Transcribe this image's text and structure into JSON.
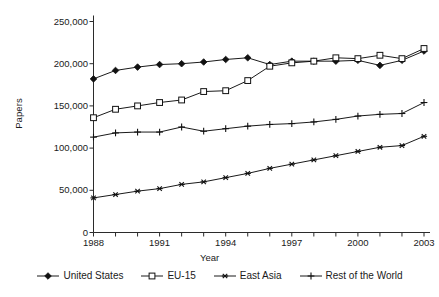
{
  "chart_data": {
    "type": "line",
    "title": "",
    "xlabel": "Year",
    "ylabel": "Papers",
    "xlim": [
      1988,
      2003
    ],
    "ylim": [
      0,
      250000
    ],
    "ytick_values": [
      0,
      50000,
      100000,
      150000,
      200000,
      250000
    ],
    "ytick_labels": [
      "0",
      "50,000",
      "100,000",
      "150,000",
      "200,000",
      "250,000"
    ],
    "xtick_values": [
      1988,
      1991,
      1994,
      1997,
      2000,
      2003
    ],
    "xtick_labels": [
      "1988",
      "1991",
      "1994",
      "1997",
      "2000",
      "2003"
    ],
    "x_minor_ticks": [
      1988,
      1989,
      1990,
      1991,
      1992,
      1993,
      1994,
      1995,
      1996,
      1997,
      1998,
      1999,
      2000,
      2001,
      2002,
      2003
    ],
    "grid": false,
    "legend_position": "bottom",
    "x": [
      1988,
      1989,
      1990,
      1991,
      1992,
      1993,
      1994,
      1995,
      1996,
      1997,
      1998,
      1999,
      2000,
      2001,
      2002,
      2003
    ],
    "series": [
      {
        "name": "United States",
        "marker": "filled-diamond",
        "color": "#000000",
        "values": [
          182000,
          192000,
          196000,
          199000,
          200000,
          202000,
          205000,
          207000,
          199000,
          203000,
          203000,
          203000,
          204000,
          198000,
          204000,
          215000
        ]
      },
      {
        "name": "EU-15",
        "marker": "open-square",
        "color": "#000000",
        "values": [
          136000,
          146000,
          150000,
          154000,
          157000,
          167000,
          168000,
          180000,
          197000,
          201000,
          203000,
          207000,
          206000,
          210000,
          206000,
          218000
        ]
      },
      {
        "name": "East Asia",
        "marker": "asterisk",
        "color": "#000000",
        "values": [
          41000,
          45000,
          49000,
          52000,
          57000,
          60000,
          65000,
          70000,
          76000,
          81000,
          86000,
          91000,
          96000,
          101000,
          103000,
          114000
        ]
      },
      {
        "name": "Rest of the World",
        "marker": "plus",
        "color": "#000000",
        "values": [
          113000,
          118000,
          119000,
          119000,
          125000,
          120000,
          123000,
          126000,
          128000,
          129000,
          131000,
          134000,
          138000,
          140000,
          141000,
          154000
        ]
      }
    ]
  }
}
